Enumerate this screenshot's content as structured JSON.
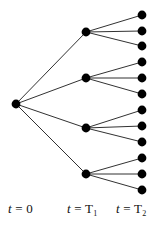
{
  "figure": {
    "kind": "scenario-tree-diagram",
    "background_color": "#ffffff",
    "node_color": "#000000",
    "edge_color": "#1a1a1a",
    "node_radius": 4.4,
    "edge_width": 0.9,
    "width": 162,
    "height": 230
  },
  "stage_labels": [
    {
      "id": "t0",
      "text_var": "t",
      "text_eq": " = ",
      "text_val": "0",
      "sub": "",
      "x": 8,
      "y": 202
    },
    {
      "id": "t1",
      "text_var": "t",
      "text_eq": " = ",
      "text_val": "T",
      "sub": "1",
      "x": 67,
      "y": 202
    },
    {
      "id": "t2",
      "text_var": "t",
      "text_eq": " = ",
      "text_val": "T",
      "sub": "2",
      "x": 116,
      "y": 202
    }
  ],
  "nodes": {
    "root": [
      {
        "id": "n0",
        "x": 16,
        "y": 104
      }
    ],
    "stage1": [
      {
        "id": "n1",
        "x": 86,
        "y": 32
      },
      {
        "id": "n2",
        "x": 86,
        "y": 78
      },
      {
        "id": "n3",
        "x": 86,
        "y": 128
      },
      {
        "id": "n4",
        "x": 86,
        "y": 174
      }
    ],
    "stage2": [
      {
        "id": "l1",
        "x": 142,
        "y": 15
      },
      {
        "id": "l2",
        "x": 142,
        "y": 31
      },
      {
        "id": "l3",
        "x": 142,
        "y": 46
      },
      {
        "id": "l4",
        "x": 142,
        "y": 62
      },
      {
        "id": "l5",
        "x": 142,
        "y": 78
      },
      {
        "id": "l6",
        "x": 142,
        "y": 94
      },
      {
        "id": "l7",
        "x": 142,
        "y": 110
      },
      {
        "id": "l8",
        "x": 142,
        "y": 126
      },
      {
        "id": "l9",
        "x": 142,
        "y": 142
      },
      {
        "id": "l10",
        "x": 142,
        "y": 158
      },
      {
        "id": "l11",
        "x": 142,
        "y": 174
      },
      {
        "id": "l12",
        "x": 142,
        "y": 190
      }
    ]
  },
  "edges": [
    {
      "from": "n0",
      "to": "n1"
    },
    {
      "from": "n0",
      "to": "n2"
    },
    {
      "from": "n0",
      "to": "n3"
    },
    {
      "from": "n0",
      "to": "n4"
    },
    {
      "from": "n1",
      "to": "l1"
    },
    {
      "from": "n1",
      "to": "l2"
    },
    {
      "from": "n1",
      "to": "l3"
    },
    {
      "from": "n2",
      "to": "l4"
    },
    {
      "from": "n2",
      "to": "l5"
    },
    {
      "from": "n2",
      "to": "l6"
    },
    {
      "from": "n3",
      "to": "l7"
    },
    {
      "from": "n3",
      "to": "l8"
    },
    {
      "from": "n3",
      "to": "l9"
    },
    {
      "from": "n4",
      "to": "l10"
    },
    {
      "from": "n4",
      "to": "l11"
    },
    {
      "from": "n4",
      "to": "l12"
    }
  ],
  "chart_data": {
    "type": "diagram",
    "stages": [
      "t = 0",
      "t = T1",
      "t = T2"
    ],
    "nodes_per_stage": [
      1,
      4,
      12
    ],
    "branching_factors": [
      4,
      3
    ],
    "total_scenarios": 12
  }
}
